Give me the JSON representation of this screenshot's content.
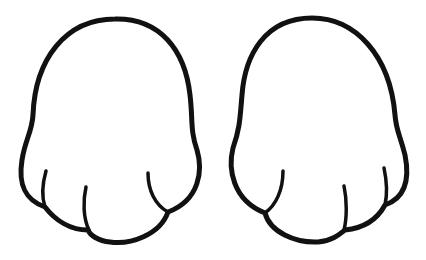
{
  "image": {
    "background": "#ffffff",
    "stroke_color": "#111111",
    "subjects": [
      {
        "name": "left-paw",
        "description": "cartoon paw outline with three finger creases, thumb-side on left"
      },
      {
        "name": "right-paw",
        "description": "cartoon paw outline with three finger creases, mirrored"
      }
    ]
  }
}
